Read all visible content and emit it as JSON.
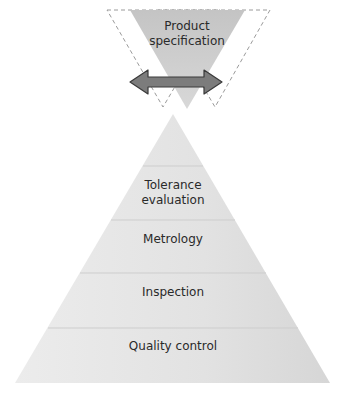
{
  "spec": {
    "line1": "Product",
    "line2": "specification"
  },
  "pyramid": {
    "levels": [
      {
        "line1": "",
        "line2": ""
      },
      {
        "line1": "Tolerance",
        "line2": "evaluation"
      },
      {
        "line1": "Metrology",
        "line2": ""
      },
      {
        "line1": "Inspection",
        "line2": ""
      },
      {
        "line1": "Quality control",
        "line2": ""
      }
    ]
  },
  "arrow": {
    "meaning": "double-headed-arrow",
    "color": "#7a7a7a"
  },
  "colors": {
    "spec_fill": "#c8c8c8",
    "pyramid_fill": "#e6e6e6",
    "band_line": "#cfcfcf",
    "dash": "#999999"
  }
}
